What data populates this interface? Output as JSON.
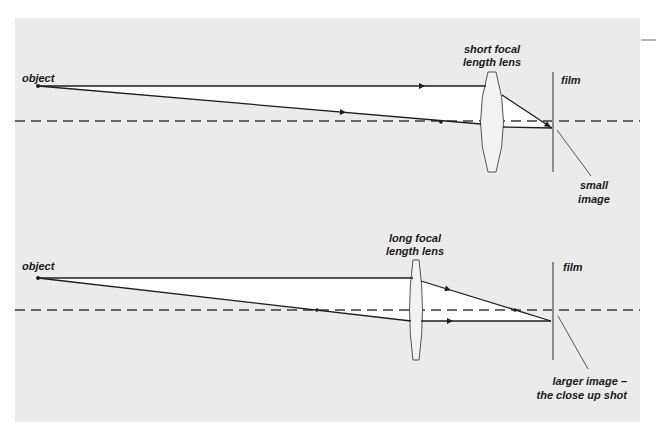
{
  "colors": {
    "panel": "#ebebeb",
    "beam": "#ffffff",
    "ray": "#1e1e1e",
    "axis": "#3a3a3a",
    "film": "#8c8c8c",
    "lens_fill": "#f2f2f2",
    "lens_stroke": "#555555"
  },
  "diagrams": [
    {
      "id": "short-focal",
      "object_label": "object",
      "lens_label": [
        "short focal",
        "length lens"
      ],
      "film_label": "film",
      "image_label": [
        "small",
        "image"
      ]
    },
    {
      "id": "long-focal",
      "object_label": "object",
      "lens_label": [
        "long focal",
        "length lens"
      ],
      "film_label": "film",
      "image_label": [
        "larger image –",
        "the close up shot"
      ]
    }
  ]
}
